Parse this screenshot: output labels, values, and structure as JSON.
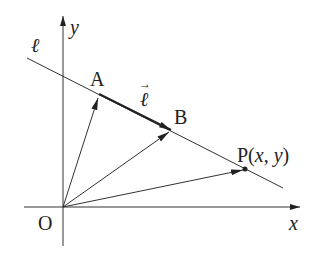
{
  "diagram": {
    "type": "vector-line-diagram",
    "colors": {
      "stroke": "#333333",
      "text": "#222222",
      "background": "#ffffff"
    },
    "axes": {
      "x_label": "x",
      "y_label": "y",
      "origin_label": "O"
    },
    "line": {
      "label": "ℓ"
    },
    "direction_vector": {
      "label": "ℓ",
      "arrow_mark": "→"
    },
    "points": {
      "A": {
        "label": "A"
      },
      "B": {
        "label": "B"
      },
      "P": {
        "label_prefix": "P(",
        "x": "x",
        "sep": ", ",
        "y": "y",
        "label_suffix": ")"
      }
    },
    "vectors_from_origin": [
      "OA",
      "OB",
      "OP"
    ]
  }
}
